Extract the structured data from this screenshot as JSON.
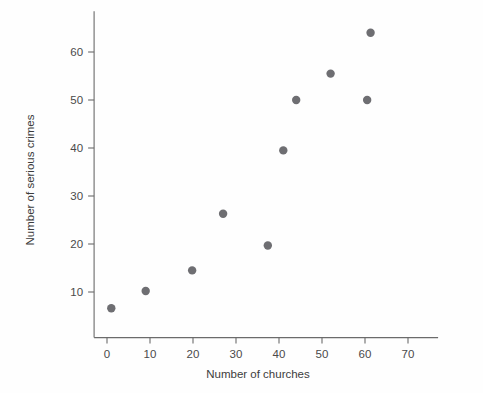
{
  "chart_data": {
    "type": "scatter",
    "title": "",
    "xlabel": "Number of churches",
    "ylabel": "Number of serious crimes",
    "xlim": [
      -3,
      77
    ],
    "ylim": [
      0,
      69
    ],
    "grid": false,
    "legend": null,
    "xticks": [
      0,
      10,
      20,
      30,
      40,
      50,
      60,
      70
    ],
    "xtick_labels": [
      "0",
      "10",
      "20",
      "30",
      "40",
      "50",
      "60",
      "70"
    ],
    "yticks": [
      10,
      20,
      30,
      40,
      50,
      60
    ],
    "ytick_labels": [
      "10",
      "20",
      "30",
      "40",
      "50",
      "60"
    ],
    "marker": "circle",
    "marker_color": "#6e6e72",
    "marker_size": 4.2,
    "points": [
      {
        "x": 1,
        "y": 6.6
      },
      {
        "x": 9,
        "y": 10.2
      },
      {
        "x": 19.8,
        "y": 14.5
      },
      {
        "x": 27,
        "y": 26.3
      },
      {
        "x": 37.4,
        "y": 19.7
      },
      {
        "x": 41,
        "y": 39.5
      },
      {
        "x": 44,
        "y": 50.0
      },
      {
        "x": 52,
        "y": 55.5
      },
      {
        "x": 60.5,
        "y": 50.0
      },
      {
        "x": 61.3,
        "y": 64.0
      }
    ]
  },
  "colors": {
    "axis": "#6b6b6b",
    "text": "#3c3c3c",
    "marker": "#6e6e72",
    "background": "#fefefe"
  }
}
